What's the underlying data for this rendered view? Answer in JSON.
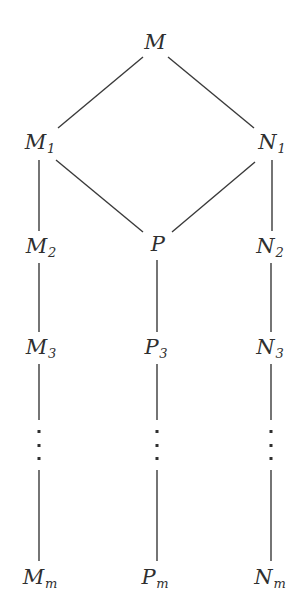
{
  "diagram": {
    "type": "lattice-hasse-diagram",
    "background_color": "#ffffff",
    "stroke_color": "#3a3a3a",
    "text_color": "#2f2f2f",
    "nodes": [
      {
        "id": "M",
        "base": "M",
        "sub": "",
        "x": 155,
        "y": 42
      },
      {
        "id": "M1",
        "base": "M",
        "sub": "1",
        "x": 40,
        "y": 143
      },
      {
        "id": "N1",
        "base": "N",
        "sub": "1",
        "x": 272,
        "y": 143
      },
      {
        "id": "M2",
        "base": "M",
        "sub": "2",
        "x": 41,
        "y": 247
      },
      {
        "id": "P",
        "base": "P",
        "sub": "",
        "x": 158,
        "y": 244
      },
      {
        "id": "N2",
        "base": "N",
        "sub": "2",
        "x": 270,
        "y": 247
      },
      {
        "id": "M3",
        "base": "M",
        "sub": "3",
        "x": 41,
        "y": 348
      },
      {
        "id": "P3",
        "base": "P",
        "sub": "3",
        "x": 156,
        "y": 348
      },
      {
        "id": "N3",
        "base": "N",
        "sub": "3",
        "x": 270,
        "y": 348
      },
      {
        "id": "Mm",
        "base": "M",
        "sub": "m",
        "x": 40,
        "y": 578
      },
      {
        "id": "Pm",
        "base": "P",
        "sub": "m",
        "x": 155,
        "y": 578
      },
      {
        "id": "Nm",
        "base": "N",
        "sub": "m",
        "x": 270,
        "y": 578
      }
    ],
    "edges": [
      {
        "from": "M",
        "to": "M1",
        "x1": 143,
        "y1": 57,
        "x2": 58,
        "y2": 128,
        "kind": "diagonal"
      },
      {
        "from": "M",
        "to": "N1",
        "x1": 168,
        "y1": 57,
        "x2": 254,
        "y2": 128,
        "kind": "diagonal"
      },
      {
        "from": "M1",
        "to": "P",
        "x1": 56,
        "y1": 160,
        "x2": 143,
        "y2": 232,
        "kind": "diagonal"
      },
      {
        "from": "N1",
        "to": "P",
        "x1": 255,
        "y1": 162,
        "x2": 172,
        "y2": 232,
        "kind": "diagonal"
      },
      {
        "from": "M1",
        "to": "M2",
        "x1": 39,
        "y1": 160,
        "x2": 39,
        "y2": 231,
        "kind": "vertical"
      },
      {
        "from": "N1",
        "to": "N2",
        "x1": 272,
        "y1": 160,
        "x2": 272,
        "y2": 231,
        "kind": "vertical"
      },
      {
        "from": "M2",
        "to": "M3",
        "x1": 39,
        "y1": 263,
        "x2": 39,
        "y2": 332,
        "kind": "vertical"
      },
      {
        "from": "P",
        "to": "P3",
        "x1": 157,
        "y1": 260,
        "x2": 157,
        "y2": 332,
        "kind": "vertical"
      },
      {
        "from": "N2",
        "to": "N3",
        "x1": 271,
        "y1": 263,
        "x2": 271,
        "y2": 332,
        "kind": "vertical"
      },
      {
        "from": "M3",
        "to": "dots-left",
        "x1": 39,
        "y1": 364,
        "x2": 39,
        "y2": 420,
        "kind": "vertical"
      },
      {
        "from": "P3",
        "to": "dots-center",
        "x1": 157,
        "y1": 364,
        "x2": 157,
        "y2": 420,
        "kind": "vertical"
      },
      {
        "from": "N3",
        "to": "dots-right",
        "x1": 271,
        "y1": 364,
        "x2": 271,
        "y2": 420,
        "kind": "vertical"
      },
      {
        "from": "dots-left",
        "to": "Mm",
        "x1": 39,
        "y1": 470,
        "x2": 39,
        "y2": 561,
        "kind": "vertical"
      },
      {
        "from": "dots-center",
        "to": "Pm",
        "x1": 157,
        "y1": 470,
        "x2": 157,
        "y2": 561,
        "kind": "vertical"
      },
      {
        "from": "dots-right",
        "to": "Nm",
        "x1": 271,
        "y1": 470,
        "x2": 271,
        "y2": 561,
        "kind": "vertical"
      }
    ],
    "ellipses": [
      {
        "id": "dots-left",
        "x": 39,
        "y": 445
      },
      {
        "id": "dots-center",
        "x": 157,
        "y": 445
      },
      {
        "id": "dots-right",
        "x": 271,
        "y": 445
      }
    ]
  }
}
